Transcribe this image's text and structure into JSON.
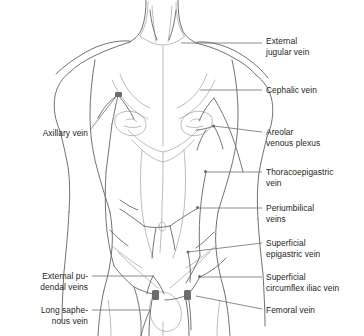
{
  "figure": {
    "background_color": "#ffffff",
    "line_color": "#58585b",
    "leader_color": "#6d6e71",
    "text_color": "#231f20",
    "node_color": "#6b6b70",
    "width": 364,
    "height": 336
  },
  "labels_right": [
    {
      "name": "external-jugular-vein",
      "text": "External\njugular vein",
      "x": 266,
      "y": 36,
      "leader": {
        "x1": 181,
        "y1": 43,
        "x2": 262,
        "y2": 43
      }
    },
    {
      "name": "cephalic-vein",
      "text": "Cephalic vein",
      "x": 266,
      "y": 85,
      "leader": {
        "x1": 200,
        "y1": 90,
        "x2": 262,
        "y2": 90
      }
    },
    {
      "name": "areolar-venous-plexus",
      "text": "Areolar\nvenous plexus",
      "x": 266,
      "y": 127,
      "leader": {
        "x1": 214,
        "y1": 126,
        "x2": 262,
        "y2": 132
      }
    },
    {
      "name": "thoracoepigastric-vein",
      "text": "Thoracoepigastric\nvein",
      "x": 266,
      "y": 167,
      "leader": {
        "x1": 206,
        "y1": 172,
        "x2": 262,
        "y2": 172
      }
    },
    {
      "name": "periumbilical-veins",
      "text": "Periumbilical\nveins",
      "x": 266,
      "y": 203,
      "leader": {
        "x1": 198,
        "y1": 208,
        "x2": 262,
        "y2": 208
      }
    },
    {
      "name": "superficial-epigastric-vein",
      "text": "Superficial\nepigastric vein",
      "x": 266,
      "y": 238,
      "leader": {
        "x1": 188,
        "y1": 252,
        "x2": 262,
        "y2": 243
      }
    },
    {
      "name": "superficial-circumflex-iliac-vein",
      "text": "Superficial\ncircumflex iliac vein",
      "x": 266,
      "y": 272,
      "leader": {
        "x1": 200,
        "y1": 277,
        "x2": 262,
        "y2": 277
      }
    },
    {
      "name": "femoral-vein",
      "text": "Femoral vein",
      "x": 266,
      "y": 305,
      "leader": {
        "x1": 196,
        "y1": 296,
        "x2": 262,
        "y2": 309
      }
    }
  ],
  "labels_left": [
    {
      "name": "axillary-vein",
      "text": "Axillary vein",
      "x": 18,
      "y": 128,
      "width": 70,
      "leader": {
        "x1": 90,
        "y1": 130,
        "x2": 118,
        "y2": 94
      }
    },
    {
      "name": "external-pudendal-veins",
      "text": "External pu-\ndendal veins",
      "x": 8,
      "y": 271,
      "width": 80,
      "leader": {
        "x1": 92,
        "y1": 276,
        "x2": 153,
        "y2": 276
      }
    },
    {
      "name": "long-saphenous-vein",
      "text": "Long saphe-\nnous vein",
      "x": 8,
      "y": 305,
      "width": 80,
      "leader": {
        "x1": 92,
        "y1": 310,
        "x2": 150,
        "y2": 310
      }
    }
  ]
}
